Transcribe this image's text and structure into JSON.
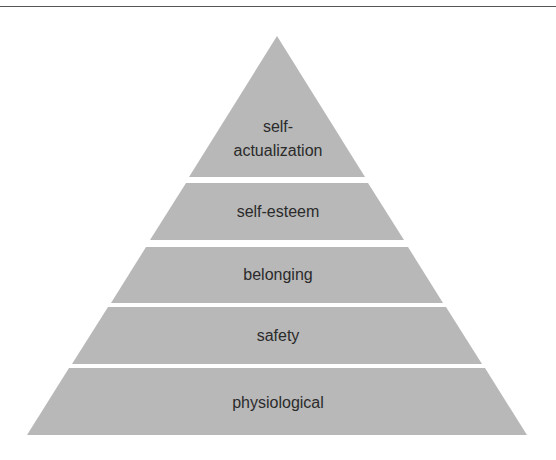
{
  "diagram": {
    "title": "",
    "type": "pyramid",
    "fill_color": "#b8b8b8",
    "text_color": "#2b2b2b",
    "levels": [
      {
        "label_line1": "self-",
        "label_line2": "actualization"
      },
      {
        "label": "self-esteem"
      },
      {
        "label": "belonging"
      },
      {
        "label": "safety"
      },
      {
        "label": "physiological"
      }
    ]
  }
}
